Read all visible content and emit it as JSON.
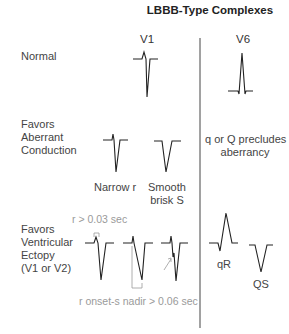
{
  "title": "LBBB-Type Complexes",
  "columns": {
    "v1": "V1",
    "v6": "V6"
  },
  "rows": {
    "normal": {
      "label": "Normal"
    },
    "aberrant": {
      "label_lines": [
        "Favors",
        "Aberrant",
        "Conduction"
      ],
      "v1_captions": {
        "narrow_r": "Narrow r",
        "smooth_1": "Smooth",
        "smooth_2": "brisk S"
      },
      "v6_note_lines": [
        "q or Q precludes",
        "aberrancy"
      ]
    },
    "ventricular": {
      "label_lines": [
        "Favors",
        "Ventricular",
        "Ectopy",
        "(V1 or V2)"
      ],
      "annotation_r_width": "r > 0.03 sec",
      "annotation_onset": "r onset-s nadir > 0.06 sec",
      "v6_captions": {
        "qr": "qR",
        "qs": "QS"
      }
    }
  },
  "colors": {
    "trace": "#222222",
    "annotation": "#9a9a9a",
    "divider": "#444444"
  }
}
